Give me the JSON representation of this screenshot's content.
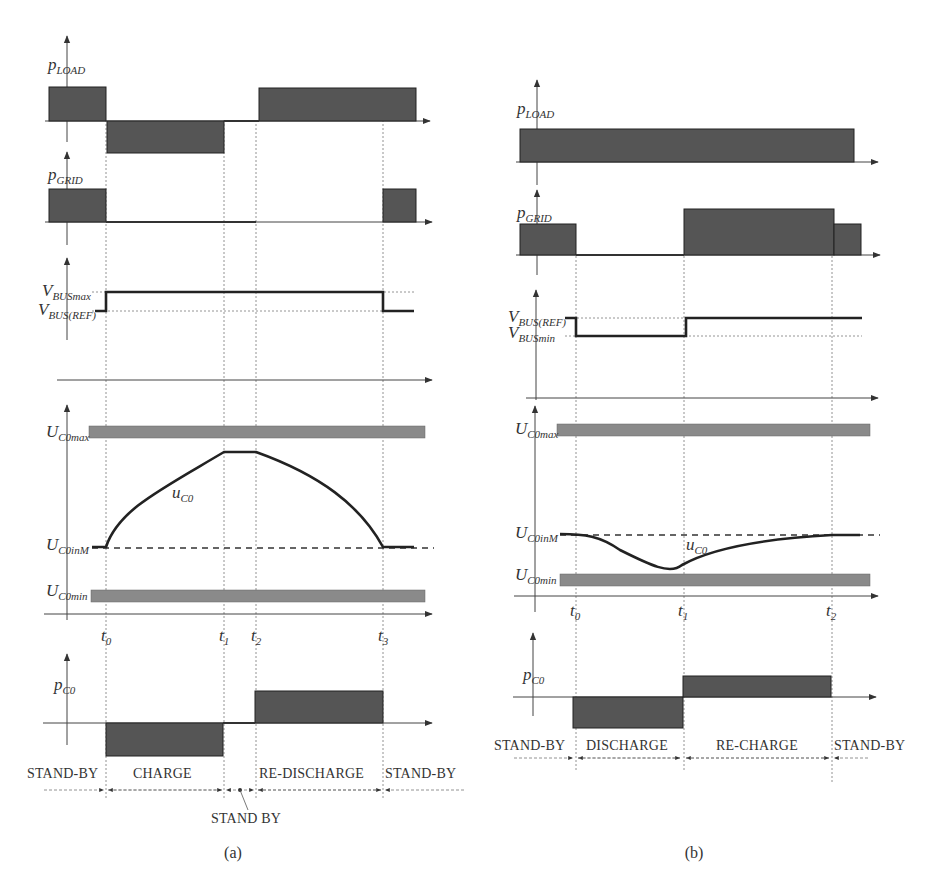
{
  "figure": {
    "panel_a": {
      "caption": "(a)",
      "signals": {
        "p_load": {
          "main": "p",
          "sub": "LOAD"
        },
        "p_grid": {
          "main": "p",
          "sub": "GRID"
        },
        "v_bus_max": {
          "main": "V",
          "sub": "BUSmax"
        },
        "v_bus_ref": {
          "main": "V",
          "sub": "BUS(REF)"
        },
        "u_c0_max": {
          "main": "U",
          "sub": "C0max"
        },
        "u_c0_inm": {
          "main": "U",
          "sub": "C0inM"
        },
        "u_c0_min": {
          "main": "U",
          "sub": "C0min"
        },
        "u_c0": {
          "main": "u",
          "sub": "C0"
        },
        "p_c0": {
          "main": "p",
          "sub": "C0"
        }
      },
      "time_marks": [
        {
          "main": "t",
          "sub": "0"
        },
        {
          "main": "t",
          "sub": "1"
        },
        {
          "main": "t",
          "sub": "2"
        },
        {
          "main": "t",
          "sub": "3"
        }
      ],
      "phases": [
        "STAND-BY",
        "CHARGE",
        "RE-DISCHARGE",
        "STAND-BY"
      ],
      "standby_note": "STAND BY"
    },
    "panel_b": {
      "caption": "(b)",
      "signals": {
        "p_load": {
          "main": "p",
          "sub": "LOAD"
        },
        "p_grid": {
          "main": "p",
          "sub": "GRID"
        },
        "v_bus_ref": {
          "main": "V",
          "sub": "BUS(REF)"
        },
        "v_bus_min": {
          "main": "V",
          "sub": "BUSmin"
        },
        "u_c0_max": {
          "main": "U",
          "sub": "C0max"
        },
        "u_c0_inm": {
          "main": "U",
          "sub": "C0inM"
        },
        "u_c0_min": {
          "main": "U",
          "sub": "C0min"
        },
        "u_c0": {
          "main": "u",
          "sub": "C0"
        },
        "p_c0": {
          "main": "p",
          "sub": "C0"
        }
      },
      "time_marks": [
        {
          "main": "t",
          "sub": "0"
        },
        {
          "main": "t",
          "sub": "1"
        },
        {
          "main": "t",
          "sub": "2"
        }
      ],
      "phases": [
        "STAND-BY",
        "DISCHARGE",
        "RE-CHARGE",
        "STAND-BY"
      ]
    }
  }
}
